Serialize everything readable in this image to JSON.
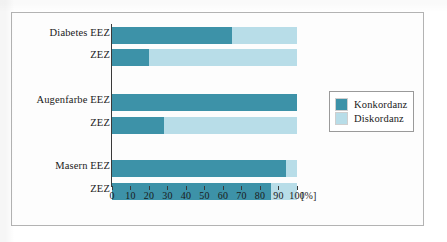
{
  "chart_data": {
    "type": "bar",
    "orientation": "horizontal",
    "stacked": true,
    "normalized_percent": true,
    "title": "",
    "xlabel": "[%]",
    "ylabel": "",
    "xlim": [
      0,
      100
    ],
    "xticks": [
      0,
      10,
      20,
      30,
      40,
      50,
      60,
      70,
      80,
      90,
      100
    ],
    "xticklabels": [
      "0",
      "10",
      "20",
      "30",
      "40",
      "50",
      "60",
      "70",
      "80",
      "90",
      "100"
    ],
    "unit": "[%]",
    "grid": false,
    "legend_position": "right",
    "groups": [
      {
        "name": "Diabetes",
        "bars": [
          {
            "label": "Diabetes EEZ",
            "konkordanz": 65,
            "diskordanz": 35
          },
          {
            "label": "ZEZ",
            "konkordanz": 20,
            "diskordanz": 80
          }
        ]
      },
      {
        "name": "Augenfarbe",
        "bars": [
          {
            "label": "Augenfarbe EEZ",
            "konkordanz": 100,
            "diskordanz": 0
          },
          {
            "label": "ZEZ",
            "konkordanz": 28,
            "diskordanz": 72
          }
        ]
      },
      {
        "name": "Masern",
        "bars": [
          {
            "label": "Masern EEZ",
            "konkordanz": 94,
            "diskordanz": 6
          },
          {
            "label": "ZEZ",
            "konkordanz": 86,
            "diskordanz": 14
          }
        ]
      }
    ],
    "categories": [
      "Diabetes EEZ",
      "ZEZ",
      "Augenfarbe EEZ",
      "ZEZ",
      "Masern EEZ",
      "ZEZ"
    ],
    "series": [
      {
        "name": "Konkordanz",
        "color": "#3d92a8",
        "values": [
          65,
          20,
          100,
          28,
          94,
          86
        ]
      },
      {
        "name": "Diskordanz",
        "color": "#b8dde8",
        "values": [
          35,
          80,
          0,
          72,
          6,
          14
        ]
      }
    ],
    "legend": [
      {
        "label": "Konkordanz",
        "color": "#3d92a8"
      },
      {
        "label": "Diskordanz",
        "color": "#b8dde8"
      }
    ]
  },
  "colors": {
    "konkordanz": "#3d92a8",
    "diskordanz": "#b8dde8",
    "axis": "#3a3a3a",
    "frame": "#b3b3b3",
    "text": "#1a1a1a"
  }
}
